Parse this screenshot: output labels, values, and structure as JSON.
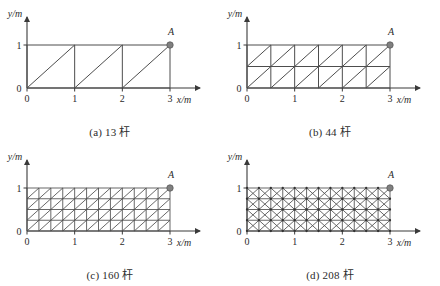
{
  "figure": {
    "background_color": "#ffffff",
    "line_color": "#4d4d4d",
    "axis_color": "#3a3a3a",
    "node_color": "#808080",
    "text_color": "#2b2b2b"
  },
  "panels": [
    {
      "id": "panel-a",
      "caption": "(a) 13 杆",
      "bar_count": 13,
      "cols": 3,
      "rows": 1,
      "bracing": "single-diagonal",
      "show_joints": false,
      "axis": {
        "xlabel": "x/m",
        "ylabel": "y/m",
        "xticks": [
          "0",
          "1",
          "2",
          "3"
        ],
        "yticks": [
          "0",
          "1"
        ],
        "xlim": [
          0,
          3
        ],
        "ylim": [
          0,
          1
        ]
      },
      "point": {
        "label": "A",
        "x": 3,
        "y": 1
      }
    },
    {
      "id": "panel-b",
      "caption": "(b) 44 杆",
      "bar_count": 44,
      "cols": 6,
      "rows": 2,
      "bracing": "single-diagonal",
      "show_joints": false,
      "axis": {
        "xlabel": "x/m",
        "ylabel": "y/m",
        "xticks": [
          "0",
          "1",
          "2",
          "3"
        ],
        "yticks": [
          "0",
          "1"
        ],
        "xlim": [
          0,
          3
        ],
        "ylim": [
          0,
          1
        ]
      },
      "point": {
        "label": "A",
        "x": 3,
        "y": 1
      }
    },
    {
      "id": "panel-c",
      "caption": "(c) 160 杆",
      "bar_count": 160,
      "cols": 12,
      "rows": 4,
      "bracing": "single-diagonal",
      "show_joints": false,
      "axis": {
        "xlabel": "x/m",
        "ylabel": "y/m",
        "xticks": [
          "0",
          "1",
          "2",
          "3"
        ],
        "yticks": [
          "0",
          "1"
        ],
        "xlim": [
          0,
          3
        ],
        "ylim": [
          0,
          1
        ]
      },
      "point": {
        "label": "A",
        "x": 3,
        "y": 1
      }
    },
    {
      "id": "panel-d",
      "caption": "(d) 208 杆",
      "bar_count": 208,
      "cols": 12,
      "rows": 4,
      "bracing": "cross-diagonal",
      "show_joints": true,
      "axis": {
        "xlabel": "x/m",
        "ylabel": "y/m",
        "xticks": [
          "0",
          "1",
          "2",
          "3"
        ],
        "yticks": [
          "0",
          "1"
        ],
        "xlim": [
          0,
          3
        ],
        "ylim": [
          0,
          1
        ]
      },
      "point": {
        "label": "A",
        "x": 3,
        "y": 1
      }
    }
  ]
}
